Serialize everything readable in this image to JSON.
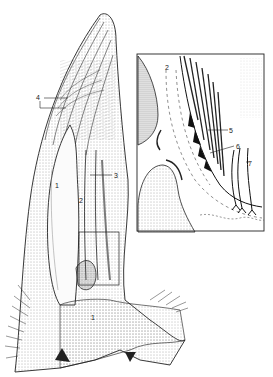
{
  "figure": {
    "type": "anatomical-line-drawing",
    "background": "#ffffff",
    "ink_color": "#1a1a1a",
    "main_view": {
      "labels": [
        {
          "id": "label-4",
          "text": "4",
          "x": 37,
          "y": 95
        },
        {
          "id": "label-3",
          "text": "3",
          "x": 113,
          "y": 172
        },
        {
          "id": "label-1-upper",
          "text": "1",
          "x": 55,
          "y": 182
        },
        {
          "id": "label-2-main",
          "text": "2",
          "x": 79,
          "y": 198
        },
        {
          "id": "label-1-lower",
          "text": "1",
          "x": 91,
          "y": 315
        }
      ]
    },
    "inset": {
      "box": {
        "x": 137,
        "y": 54,
        "width": 127,
        "height": 177
      },
      "labels": [
        {
          "id": "label-2-inset",
          "text": "2",
          "x": 165,
          "y": 65
        },
        {
          "id": "label-5",
          "text": "5",
          "x": 229,
          "y": 128
        },
        {
          "id": "label-6",
          "text": "6",
          "x": 236,
          "y": 144
        },
        {
          "id": "label-7",
          "text": "7",
          "x": 248,
          "y": 161
        }
      ]
    },
    "detail_box": {
      "x": 79,
      "y": 232,
      "width": 40,
      "height": 53
    }
  }
}
